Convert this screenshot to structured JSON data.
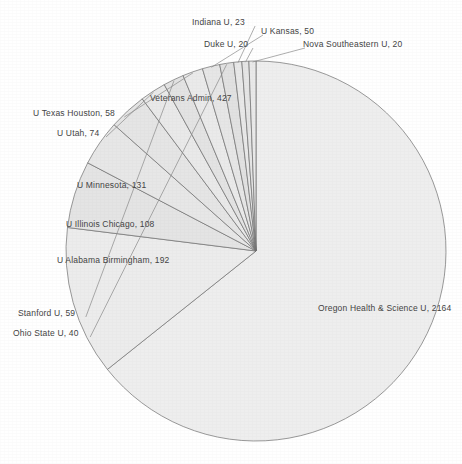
{
  "chart_data": {
    "type": "pie",
    "title": "",
    "subtitle": "",
    "xlabel": "",
    "ylabel": "",
    "legend_position": "none",
    "grid": false,
    "label_format": "{name}, {value}",
    "total": 3203,
    "categories": [
      "Oregon Health & Science U",
      "Veterans Admin",
      "U Alabama Birmingham",
      "U Minnesota",
      "U Illinois Chicago",
      "U Utah",
      "Stanford U",
      "U Texas Houston",
      "U Kansas",
      "Ohio State U",
      "Indiana U",
      "Duke U",
      "Nova Southeastern U"
    ],
    "values": [
      2164,
      427,
      192,
      131,
      108,
      74,
      59,
      58,
      50,
      40,
      23,
      20,
      20
    ],
    "slices": [
      {
        "name": "Oregon Health & Science U",
        "value": 2164,
        "label": "Oregon Health & Science U, 2164",
        "color": "#eeeeee",
        "label_inside": true,
        "label_x": 318,
        "label_y": 303
      },
      {
        "name": "Veterans Admin",
        "value": 427,
        "label": "Veterans Admin, 427",
        "color": "#ececec",
        "label_inside": true,
        "label_x": 150,
        "label_y": 93
      },
      {
        "name": "U Alabama Birmingham",
        "value": 192,
        "label": "U Alabama Birmingham, 192",
        "color": "#e4e4e4",
        "label_inside": true,
        "label_x": 57,
        "label_y": 255
      },
      {
        "name": "U Minnesota",
        "value": 131,
        "label": "U Minnesota, 131",
        "color": "#e7e7e7",
        "label_inside": true,
        "label_x": 77,
        "label_y": 180
      },
      {
        "name": "U Illinois Chicago",
        "value": 108,
        "label": "U Illinois Chicago, 108",
        "color": "#e5e5e5",
        "label_inside": true,
        "label_x": 66,
        "label_y": 219
      },
      {
        "name": "U Utah",
        "value": 74,
        "label": "U Utah, 74",
        "color": "#e9e9e9",
        "label_inside": false,
        "label_x": 57,
        "label_y": 128
      },
      {
        "name": "Stanford U",
        "value": 59,
        "label": "Stanford U, 59",
        "color": "#e3e3e3",
        "label_inside": false,
        "label_x": 18,
        "label_y": 308
      },
      {
        "name": "U Texas Houston",
        "value": 58,
        "label": "U Texas Houston, 58",
        "color": "#eaeaea",
        "label_inside": false,
        "label_x": 33,
        "label_y": 108
      },
      {
        "name": "U Kansas",
        "value": 50,
        "label": "U Kansas, 50",
        "color": "#e6e6e6",
        "label_inside": false,
        "label_x": 261,
        "label_y": 26
      },
      {
        "name": "Ohio State U",
        "value": 40,
        "label": "Ohio State U, 40",
        "color": "#e1e1e1",
        "label_inside": false,
        "label_x": 13,
        "label_y": 328
      },
      {
        "name": "Indiana U",
        "value": 23,
        "label": "Indiana U, 23",
        "color": "#e8e8e8",
        "label_inside": false,
        "label_x": 192,
        "label_y": 17
      },
      {
        "name": "Duke U",
        "value": 20,
        "label": "Duke U, 20",
        "color": "#e5e5e5",
        "label_inside": false,
        "label_x": 204,
        "label_y": 39
      },
      {
        "name": "Nova Southeastern U",
        "value": 20,
        "label": "Nova Southeastern U, 20",
        "color": "#e9e9e9",
        "label_inside": false,
        "label_x": 303,
        "label_y": 39
      }
    ],
    "geometry": {
      "center_x": 256,
      "center_y": 251,
      "radius": 190,
      "start_angle_deg": -90
    }
  }
}
